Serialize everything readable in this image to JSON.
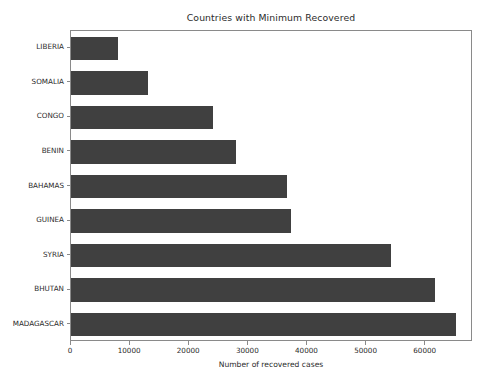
{
  "chart_data": {
    "type": "bar",
    "orientation": "horizontal",
    "title": "Countries with Minimum Recovered",
    "xlabel": "Number of recovered cases",
    "ylabel": "",
    "categories": [
      "LIBERIA",
      "SOMALIA",
      "CONGO",
      "BENIN",
      "BAHAMAS",
      "GUINEA",
      "SYRIA",
      "BHUTAN",
      "MADAGASCAR"
    ],
    "values": [
      7900,
      13000,
      24000,
      27900,
      36500,
      37200,
      54200,
      61500,
      65200
    ],
    "xlim": [
      0,
      68000
    ],
    "xticks": [
      0,
      10000,
      20000,
      30000,
      40000,
      50000,
      60000
    ],
    "xtick_labels": [
      "0",
      "10000",
      "20000",
      "30000",
      "40000",
      "50000",
      "60000"
    ],
    "ytick_labels": [
      "LIBERIA",
      "SOMALIA",
      "CONGO",
      "BENIN",
      "BAHAMAS",
      "GUINEA",
      "SYRIA",
      "BHUTAN",
      "MADAGASCAR"
    ],
    "grid": false,
    "legend": null,
    "bar_color": "#404040",
    "axes_color": "#8a8a8a",
    "background": "#ffffff"
  }
}
